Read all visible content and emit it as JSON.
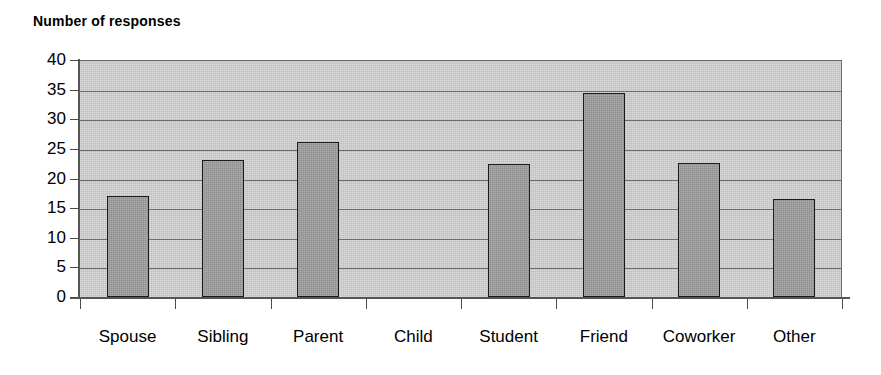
{
  "chart_data": {
    "type": "bar",
    "title": "Number of responses",
    "xlabel": "",
    "ylabel": "",
    "categories": [
      "Spouse",
      "Sibling",
      "Parent",
      "Child",
      "Student",
      "Friend",
      "Coworker",
      "Other"
    ],
    "values": [
      17.0,
      23.2,
      26.1,
      0,
      22.4,
      34.4,
      22.6,
      16.5
    ],
    "ylim": [
      0,
      40
    ],
    "ytick_step": 5,
    "yticks": [
      40,
      35,
      30,
      25,
      20,
      15,
      10,
      5,
      0
    ],
    "grid": true,
    "legend": false,
    "legend_position": "none",
    "colors": {
      "bar_fill": "#8f8f8f",
      "bar_outline": "#1a1a1a",
      "plot_background": "#bfbfbf",
      "gridline": "#6e6e6e",
      "axis": "#555555",
      "text": "#000000",
      "page_background": "#ffffff"
    }
  }
}
